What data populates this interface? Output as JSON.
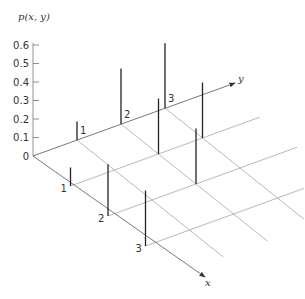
{
  "chart_data": {
    "type": "3d-stem",
    "title": "",
    "zlabel": "p(x, y)",
    "xlabel": "x",
    "ylabel": "y",
    "z_ticks": [
      "0",
      "0.1",
      "0.2",
      "0.3",
      "0.4",
      "0.5",
      "0.6"
    ],
    "x_ticks": [
      "1",
      "2",
      "3"
    ],
    "y_ticks": [
      "1",
      "2",
      "3"
    ],
    "zlim": [
      0,
      0.6
    ],
    "grid": true,
    "points": [
      {
        "x": 0,
        "y": 1,
        "p": 0.1
      },
      {
        "x": 0,
        "y": 2,
        "p": 0.3
      },
      {
        "x": 0,
        "y": 3,
        "p": 0.35
      },
      {
        "x": 1,
        "y": 0,
        "p": 0.1
      },
      {
        "x": 1,
        "y": 2,
        "p": 0.3
      },
      {
        "x": 1,
        "y": 3,
        "p": 0.3
      },
      {
        "x": 2,
        "y": 0,
        "p": 0.28
      },
      {
        "x": 2,
        "y": 2,
        "p": 0.3
      },
      {
        "x": 3,
        "y": 0,
        "p": 0.3
      }
    ]
  }
}
